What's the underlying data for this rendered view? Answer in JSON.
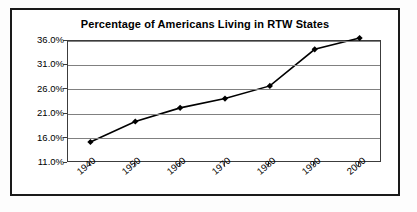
{
  "chart_data": {
    "type": "line",
    "title": "Percentage of Americans Living in RTW States",
    "xlabel": "",
    "ylabel": "",
    "categories": [
      "1940",
      "1950",
      "1960",
      "1970",
      "1980",
      "1990",
      "2000"
    ],
    "x": [
      1940,
      1950,
      1960,
      1970,
      1980,
      1990,
      2000
    ],
    "series": [
      {
        "name": "Percentage of Americans Living in RTW States",
        "values": [
          15.3,
          19.5,
          22.3,
          24.2,
          26.8,
          34.3,
          36.6
        ]
      }
    ],
    "values": [
      15.3,
      19.5,
      22.3,
      24.2,
      26.8,
      34.3,
      36.6
    ],
    "ylim": [
      11.0,
      36.0
    ],
    "yticks": [
      11.0,
      16.0,
      21.0,
      26.0,
      31.0,
      36.0
    ],
    "ytick_labels": [
      "11.0%",
      "16.0%",
      "21.0%",
      "26.0%",
      "31.0%",
      "36.0%"
    ],
    "xtick_labels": [
      "1940",
      "1950",
      "1960",
      "1970",
      "1980",
      "1990",
      "2000"
    ],
    "xtick_rotation": -40,
    "grid": "horizontal",
    "legend": "none",
    "marker": "diamond",
    "line_color": "#000000",
    "marker_color": "#000000",
    "gridline_color": "#808080",
    "plot_border_color": "#3c3c3c",
    "frame_border_color": "#1a1a1a",
    "background_color": "#ffffff"
  },
  "chart": {
    "title": "Percentage of Americans Living in RTW States",
    "y_axis": {
      "labels": [
        "36.0%",
        "31.0%",
        "26.0%",
        "21.0%",
        "16.0%",
        "11.0%"
      ]
    },
    "x_axis": {
      "labels": [
        "1940",
        "1950",
        "1960",
        "1970",
        "1980",
        "1990",
        "2000"
      ]
    }
  }
}
